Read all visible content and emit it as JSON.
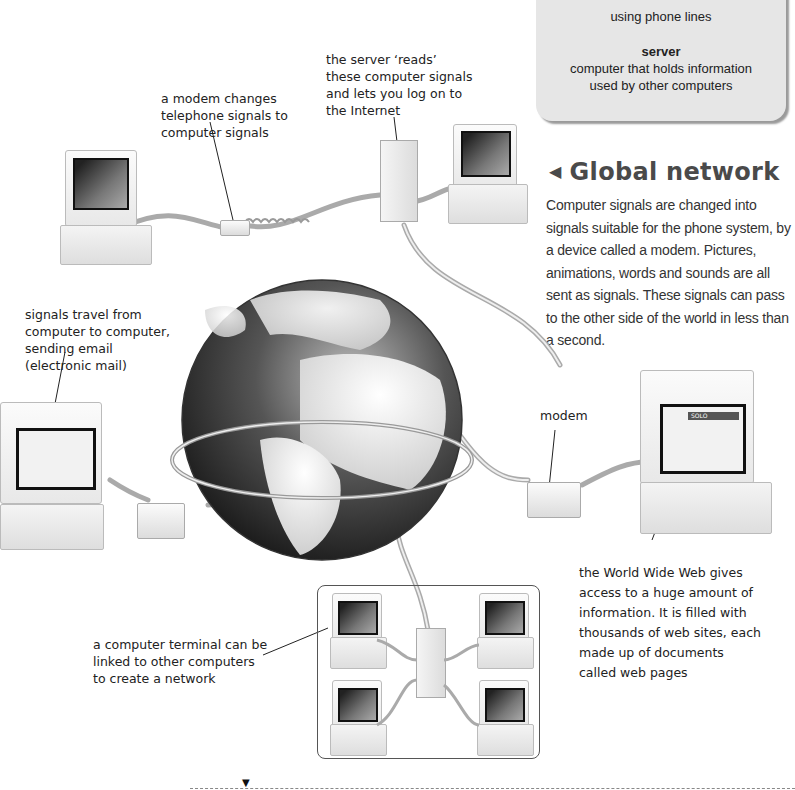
{
  "glossary": {
    "modem_definition_tail": "using phone lines",
    "terms": [
      {
        "term": "server",
        "definition": "computer that holds information used by other computers"
      }
    ]
  },
  "section": {
    "heading_icon": "left-triangle-icon",
    "heading": "Global network",
    "body": "Computer signals are changed into signals suitable for the phone system, by a device called a modem. Pictures, animations, words and sounds are all sent as signals. These signals can pass to the other side of the world in less than a second."
  },
  "captions": {
    "modem_changes": "a modem changes\ntelephone signals to\ncomputer signals",
    "server_reads": "the server ‘reads’\nthese computer signals\nand lets you log on to\nthe Internet",
    "signals_travel": "signals travel from\ncomputer to computer,\nsending email\n(electronic mail)",
    "modem": "modem",
    "world_wide_web": "the World Wide Web gives\naccess to a huge amount of\ninformation. It is filled with\nthousands of web sites, each\nmade up of documents\ncalled web pages",
    "terminal_network": "a computer terminal can be\nlinked to other computers\nto create a network"
  },
  "screen_labels": {
    "web_page_banner": "SOLO"
  },
  "footer": {
    "marker_icon": "down-triangle-icon"
  },
  "colors": {
    "glossary_bg": "#e6e6e6",
    "heading": "#4a4a4a",
    "body_text": "#333333",
    "globe_ocean": "#2a2a2a",
    "globe_land": "#e8e8e8"
  }
}
